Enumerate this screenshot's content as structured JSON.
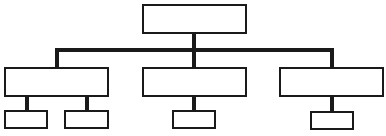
{
  "diagram": {
    "type": "hierarchy / org chart",
    "line_color": "#1a1a1a",
    "box_border_color": "#1a1a1a",
    "root": {
      "label": "",
      "children": [
        {
          "label": "",
          "children": [
            {
              "label": ""
            },
            {
              "label": ""
            }
          ]
        },
        {
          "label": "",
          "children": [
            {
              "label": ""
            }
          ]
        },
        {
          "label": "",
          "children": [
            {
              "label": ""
            }
          ]
        }
      ]
    }
  }
}
